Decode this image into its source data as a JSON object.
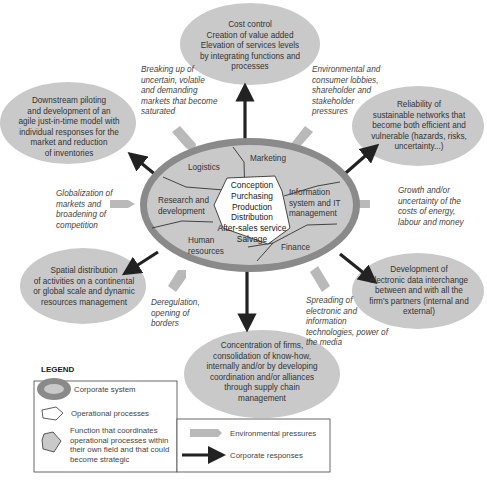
{
  "colors": {
    "bubble_fill": "#c9c9c9",
    "corporate_ring": "#8a8a8a",
    "function_fill": "#c9c9c9",
    "core_fill": "#ffffff",
    "pressure_arrow": "#b9b9b9",
    "response_arrow": "#222222"
  },
  "responses": [
    {
      "id": "cost-control",
      "lines": [
        "Cost control",
        "Creation of value added",
        "Elevation of services levels",
        "by integrating functions and",
        "processes"
      ]
    },
    {
      "id": "reliability",
      "lines": [
        "Reliability of",
        "sustainable networks that",
        "become both efficient and",
        "vulnerable (hazards, risks,",
        "uncertainty...)"
      ]
    },
    {
      "id": "edi",
      "lines": [
        "Development of",
        "electronic data interchange",
        "between and with all the",
        "firm's partners (internal and",
        "external)"
      ]
    },
    {
      "id": "concentration",
      "lines": [
        "Concentration of firms,",
        "consolidation of know-how,",
        "internally and/or by developing",
        "coordination and/or alliances",
        "through supply chain",
        "management"
      ]
    },
    {
      "id": "spatial",
      "lines": [
        "Spatial distribution",
        "of activities on a continental",
        "or global scale and dynamic",
        "resources management"
      ]
    },
    {
      "id": "downstream",
      "lines": [
        "Downstream piloting",
        "and development of an",
        "agile just-in-time model with",
        "individual responses for the",
        "market and reduction",
        "of inventories"
      ]
    }
  ],
  "pressures": [
    {
      "id": "breaking-up",
      "lines": [
        "Breaking up of",
        "uncertain, volatile",
        "and demanding",
        "markets that become",
        "saturated"
      ]
    },
    {
      "id": "environmental",
      "lines": [
        "Environmental and",
        "consumer lobbies,",
        "shareholder and",
        "stakeholder",
        "pressures"
      ]
    },
    {
      "id": "growth",
      "lines": [
        "Growth and/or",
        "uncertainty of the",
        "costs of energy,",
        "labour and money"
      ]
    },
    {
      "id": "spreading",
      "lines": [
        "Spreading of",
        "electronic and",
        "information",
        "technologies, power of",
        "the media"
      ]
    },
    {
      "id": "deregulation",
      "lines": [
        "Deregulation,",
        "opening of",
        "borders"
      ]
    },
    {
      "id": "globalization",
      "lines": [
        "Globalization of",
        "markets and",
        "broadening of",
        "competition"
      ]
    }
  ],
  "corporate_system": {
    "functions": {
      "logistics": [
        "Logistics"
      ],
      "marketing": [
        "Marketing"
      ],
      "information": [
        "Information",
        "system and IT",
        "management"
      ],
      "finance": [
        "Finance"
      ],
      "human_resources": [
        "Human",
        "resources"
      ],
      "research": [
        "Research and",
        "development"
      ]
    },
    "operational_processes": [
      "Conception",
      "Purchasing",
      "Production",
      "Distribution",
      "After-sales service",
      "Salvage"
    ]
  },
  "legend": {
    "title": "LEGEND",
    "corporate_system": "Corporate system",
    "operational_processes": "Operational processes",
    "function": [
      "Function that coordinates",
      "operational processes within",
      "their own field and that could",
      "become strategic"
    ],
    "environmental_pressures": "Environmental pressures",
    "corporate_responses": "Corporate responses"
  }
}
